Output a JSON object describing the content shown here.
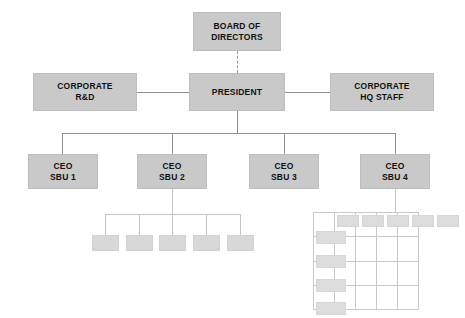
{
  "diagram": {
    "type": "org-chart",
    "colors": {
      "node_fill": "#c9c9c9",
      "leaf_fill": "#d8d8d8",
      "leaf_pale_fill": "#dcdcdc",
      "connector": "#8e8e8e",
      "grid": "#c8c8c8",
      "background": "#ffffff",
      "text": "#111111"
    }
  },
  "nodes": {
    "board": {
      "line1": "BOARD OF",
      "line2": "DIRECTORS"
    },
    "president": {
      "line1": "PRESIDENT",
      "line2": ""
    },
    "corporate_rd": {
      "line1": "CORPORATE",
      "line2": "R&D"
    },
    "corporate_hq": {
      "line1": "CORPORATE",
      "line2": "HQ STAFF"
    },
    "ceo_sbu_1": {
      "line1": "CEO",
      "line2": "SBU 1"
    },
    "ceo_sbu_2": {
      "line1": "CEO",
      "line2": "SBU 2"
    },
    "ceo_sbu_3": {
      "line1": "CEO",
      "line2": "SBU 3"
    },
    "ceo_sbu_4": {
      "line1": "CEO",
      "line2": "SBU 4"
    }
  },
  "sbu2_children": [
    {
      "label": ""
    },
    {
      "label": ""
    },
    {
      "label": ""
    },
    {
      "label": ""
    },
    {
      "label": ""
    }
  ],
  "sbu4_matrix": {
    "columns": [
      {
        "label": ""
      },
      {
        "label": ""
      },
      {
        "label": ""
      },
      {
        "label": ""
      },
      {
        "label": ""
      }
    ],
    "rows": [
      {
        "label": ""
      },
      {
        "label": ""
      },
      {
        "label": ""
      },
      {
        "label": ""
      }
    ]
  }
}
